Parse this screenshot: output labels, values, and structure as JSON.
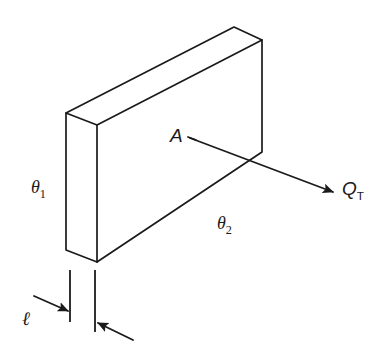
{
  "figure": {
    "type": "engineering-diagram",
    "background_color": "#ffffff",
    "line_color": "#1a1a1a",
    "labels": {
      "theta1": "θ",
      "theta1_sub": "1",
      "theta2": "θ",
      "theta2_sub": "2",
      "area": "A",
      "heat_flow": "Q",
      "heat_flow_sub": "T",
      "thickness": "ℓ"
    },
    "geometry": {
      "slab": {
        "front_top_left": [
          97,
          125
        ],
        "front_top_right": [
          262,
          40
        ],
        "front_bottom_right": [
          262,
          152
        ],
        "front_bottom_left": [
          97,
          262
        ],
        "back_top_left": [
          66,
          113
        ],
        "back_top_right": [
          234,
          27
        ],
        "back_bottom_left": [
          66,
          250
        ]
      },
      "heat_arrow": {
        "from": [
          190,
          138
        ],
        "to": [
          333,
          192
        ]
      },
      "area_leader": {
        "from": [
          190,
          138
        ],
        "to": [
          206,
          144
        ]
      },
      "dimension": {
        "left_extension_line": {
          "x": 70,
          "y1": 270,
          "y2": 322
        },
        "right_extension_line": {
          "x": 95,
          "y1": 270,
          "y2": 332
        },
        "left_arrow": {
          "from": [
            34,
            296
          ],
          "to": [
            70,
            312
          ]
        },
        "right_arrow": {
          "from": [
            133,
            340
          ],
          "to": [
            96,
            322
          ]
        }
      }
    }
  }
}
